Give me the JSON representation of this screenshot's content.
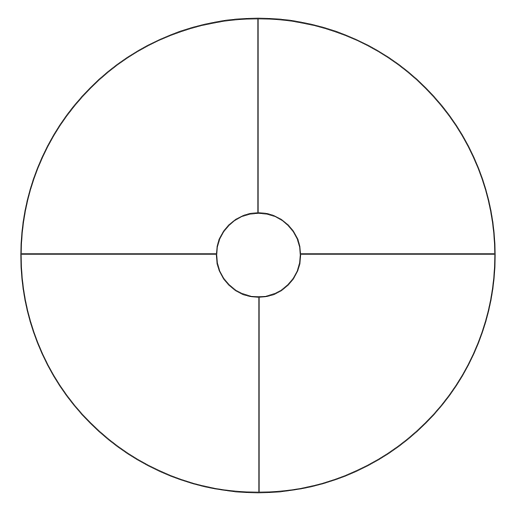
{
  "diagram": {
    "type": "quadrant-circle",
    "canvas": {
      "width": 511,
      "height": 511,
      "background": "#ffffff"
    },
    "stroke_color": "#222222",
    "outer_circle": {
      "cx": 258,
      "cy": 255.5,
      "r": 237
    },
    "inner_circle": {
      "cx": 258.5,
      "cy": 255,
      "r": 42
    },
    "dividers": [
      {
        "name": "top",
        "x1": 258,
        "y1": 18.5,
        "x2": 258,
        "y2": 213
      },
      {
        "name": "bottom",
        "x1": 259,
        "y1": 297,
        "x2": 259,
        "y2": 492.5
      },
      {
        "name": "left",
        "x1": 21,
        "y1": 254,
        "x2": 216.5,
        "y2": 254
      },
      {
        "name": "right",
        "x1": 300.5,
        "y1": 254,
        "x2": 495,
        "y2": 254
      }
    ],
    "quadrants": [
      "top-left",
      "top-right",
      "bottom-left",
      "bottom-right"
    ],
    "labels": []
  }
}
